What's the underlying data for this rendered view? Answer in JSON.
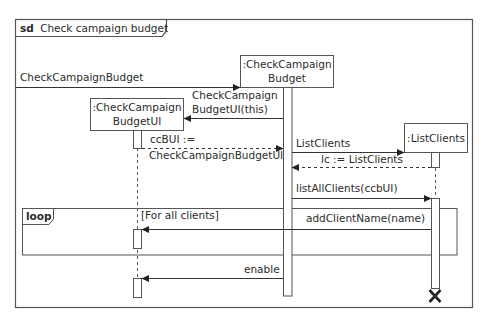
{
  "frame": {
    "keyword": "sd",
    "title": "Check campaign budget"
  },
  "lifelines": [
    {
      "id": "ccb",
      "line1": ":CheckCampaign",
      "line2": "Budget"
    },
    {
      "id": "ccbui",
      "line1": ":CheckCampaign",
      "line2": "BudgetUI"
    },
    {
      "id": "lc",
      "line1": ":ListClients",
      "line2": ""
    }
  ],
  "messages": [
    {
      "id": "m1",
      "label": "CheckCampaignBudget",
      "kind": "sync"
    },
    {
      "id": "m2",
      "label1": "CheckCampaign",
      "label2": "BudgetUI(this)",
      "kind": "create"
    },
    {
      "id": "m3",
      "label1": "ccBUI :=",
      "label2": "CheckCampaignBudgetUI",
      "kind": "return"
    },
    {
      "id": "m4",
      "label": "ListClients",
      "kind": "create"
    },
    {
      "id": "m5",
      "label": "lc := ListClients",
      "kind": "return"
    },
    {
      "id": "m6",
      "label": "listAllClients(ccbUI)",
      "kind": "sync"
    },
    {
      "id": "m7",
      "label": "addClientName(name)",
      "kind": "sync"
    },
    {
      "id": "m8",
      "label": "enable",
      "kind": "sync"
    }
  ],
  "fragment": {
    "operator": "loop",
    "guard": "[For all clients]"
  },
  "destroy": {
    "glyph": "X"
  },
  "colors": {
    "stroke": "#555555",
    "text": "#2b2b2b",
    "background": "#ffffff"
  }
}
